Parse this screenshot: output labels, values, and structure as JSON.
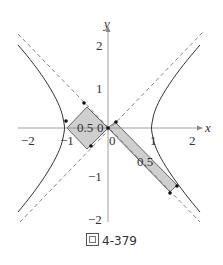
{
  "figure": {
    "caption_prefix": "圖",
    "caption_number": "4-379",
    "axes": {
      "x_label": "x",
      "y_label": "y",
      "x_ticks": [
        "−2",
        "−1",
        "0",
        "1",
        "2"
      ],
      "y_ticks": [
        "2",
        "1",
        "−1",
        "−2"
      ]
    },
    "curves": {
      "hyperbola": "x^2 - y^2 = 1",
      "asymptotes": [
        "y = x",
        "y = -x"
      ]
    },
    "shaded_regions": [
      {
        "label": "0.5",
        "desc": "square between origin and left vertex (-1,0)"
      },
      {
        "label": "0.5",
        "desc": "long strip from origin to right branch"
      }
    ],
    "region_labels": [
      "0.5",
      "0",
      "0.5"
    ],
    "colors": {
      "axis": "#888888",
      "curve": "#333333",
      "shade": "#cccccc",
      "dash": "#777777"
    }
  }
}
